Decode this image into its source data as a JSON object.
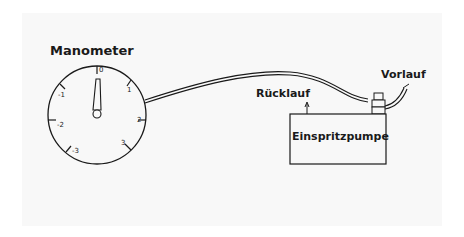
{
  "diagram": {
    "title": "Manometer",
    "gauge": {
      "ticks": [
        "0",
        "1",
        "2",
        "3",
        "-1",
        "-2",
        "-3"
      ],
      "needle_value": "0"
    },
    "labels": {
      "return_line": "Rücklauf",
      "supply_line": "Vorlauf",
      "pump": "Einspritzpumpe"
    },
    "colors": {
      "ink": "#1a1a1a",
      "paper": "#f8f8f8"
    }
  }
}
